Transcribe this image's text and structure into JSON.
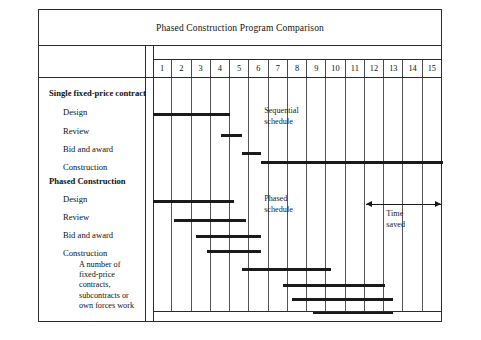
{
  "chart_data": {
    "type": "bar",
    "title": "Phased Construction Program Comparison",
    "xlabel": "",
    "ylabel": "",
    "orientation": "horizontal",
    "axis_ticks": [
      "1",
      "2",
      "3",
      "4",
      "5",
      "6",
      "7",
      "8",
      "9",
      "10",
      "11",
      "12",
      "13",
      "14",
      "15"
    ],
    "xlim": [
      1,
      16
    ],
    "grid": true,
    "groups": [
      {
        "name": "Single fixed-price contract",
        "annotation": "Sequential schedule",
        "tasks": [
          {
            "label": "Design",
            "start": 1.0,
            "end": 5.0
          },
          {
            "label": "Review",
            "start": 4.5,
            "end": 5.6
          },
          {
            "label": "Bid and award",
            "start": 5.6,
            "end": 6.6
          },
          {
            "label": "Construction",
            "start": 6.6,
            "end": 16.0
          }
        ]
      },
      {
        "name": "Phased Construction",
        "annotation": "Phased schedule",
        "tasks": [
          {
            "label": "Design",
            "start": 1.0,
            "end": 5.2
          },
          {
            "label": "Review",
            "start": 2.1,
            "end": 5.8
          },
          {
            "label": "Bid and award",
            "start": 3.2,
            "end": 6.6
          },
          {
            "label": "Construction",
            "start": 3.8,
            "end": 6.6
          }
        ],
        "subnote": "A number of fixed-price contracts, subcontracts or own forces work",
        "subcontract_bars": [
          {
            "start": 5.6,
            "end": 10.2
          },
          {
            "start": 7.7,
            "end": 13.0
          },
          {
            "start": 8.2,
            "end": 13.4
          },
          {
            "start": 9.3,
            "end": 13.4
          }
        ]
      }
    ],
    "time_saved": {
      "label": "Time saved",
      "start": 12.0,
      "end": 15.9
    }
  },
  "sublabel_lines": [
    "A number of",
    "fixed-price",
    "contracts,",
    "subcontracts or",
    "own forces work"
  ]
}
